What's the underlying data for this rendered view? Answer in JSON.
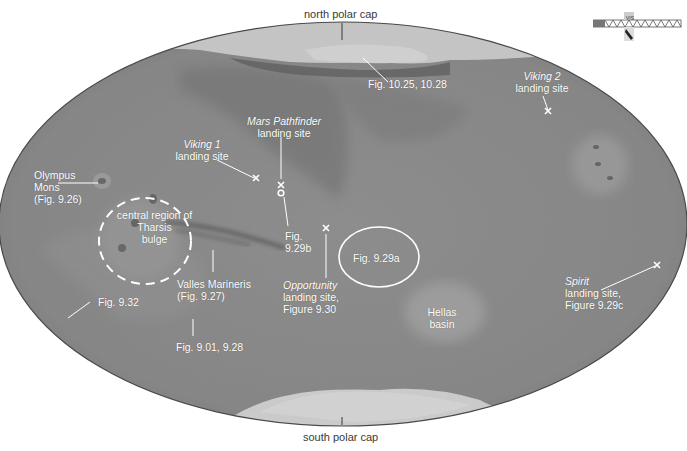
{
  "map": {
    "subject": "Mars",
    "projection": "elliptical global map",
    "colors": {
      "background": "#ffffff",
      "surface": "#8a8a8a",
      "label": "#ffffff",
      "outer_label": "#3a3a3a"
    }
  },
  "outer_labels": {
    "north": "north polar cap",
    "south": "south polar cap"
  },
  "labels": {
    "polar_fig": "Fig. 10.25, 10.28",
    "viking2_name": "Viking 2",
    "viking2_sub": "landing site",
    "pathfinder_name": "Mars Pathfinder",
    "pathfinder_sub": "landing site",
    "viking1_name": "Viking 1",
    "viking1_sub": "landing site",
    "olympus_1": "Olympus",
    "olympus_2": "Mons",
    "olympus_3": "(Fig. 9.26)",
    "tharsis_1": "central region of",
    "tharsis_2": "Tharsis",
    "tharsis_3": "bulge",
    "fig929b_1": "Fig.",
    "fig929b_2": "9.29b",
    "fig929a": "Fig. 9.29a",
    "valles_1": "Valles Marineris",
    "valles_2": "(Fig. 9.27)",
    "opportunity_name": "Opportunity",
    "opportunity_sub1": "landing site,",
    "opportunity_sub2": "Figure 9.30",
    "fig932": "Fig. 9.32",
    "fig901": "Fig. 9.01, 9.28",
    "hellas_1": "Hellas",
    "hellas_2": "basin",
    "spirit_name": "Spirit",
    "spirit_sub1": "landing site,",
    "spirit_sub2": "Figure 9.29c"
  },
  "orientation_widget": {
    "label": "VIS"
  },
  "markers": [
    {
      "name": "viking-1",
      "symbol": "x"
    },
    {
      "name": "mars-pathfinder",
      "symbol": "x"
    },
    {
      "name": "opportunity",
      "symbol": "x"
    },
    {
      "name": "viking-2",
      "symbol": "x"
    },
    {
      "name": "spirit",
      "symbol": "x"
    }
  ]
}
